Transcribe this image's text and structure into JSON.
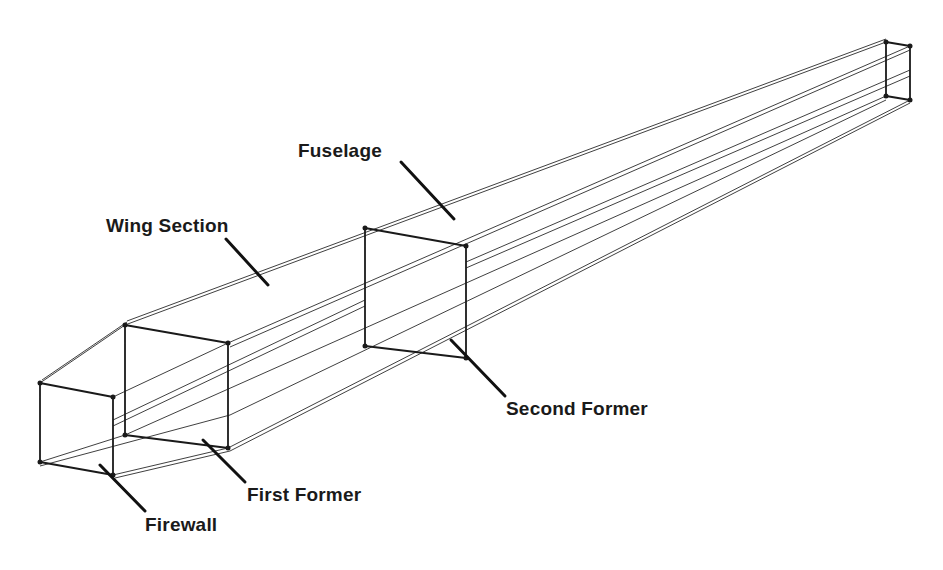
{
  "diagram": {
    "type": "fuselage-frame-perspective-sketch",
    "labels": {
      "fuselage": "Fuselage",
      "wing_section": "Wing Section",
      "second_former": "Second Former",
      "first_former": "First Former",
      "firewall": "Firewall"
    },
    "frames": [
      {
        "name": "firewall",
        "corners": [
          [
            40,
            383
          ],
          [
            113,
            397
          ],
          [
            113,
            475
          ],
          [
            40,
            462
          ]
        ]
      },
      {
        "name": "first-former",
        "corners": [
          [
            125,
            325
          ],
          [
            228,
            343
          ],
          [
            228,
            448
          ],
          [
            125,
            435
          ]
        ]
      },
      {
        "name": "second-former",
        "corners": [
          [
            365,
            228
          ],
          [
            466,
            246
          ],
          [
            466,
            358
          ],
          [
            365,
            346
          ]
        ]
      },
      {
        "name": "tail-post",
        "corners": [
          [
            886,
            42
          ],
          [
            910,
            46
          ],
          [
            910,
            100
          ],
          [
            886,
            96
          ]
        ]
      }
    ],
    "colors": {
      "line": "#1a1a1a",
      "background": "#ffffff"
    }
  }
}
